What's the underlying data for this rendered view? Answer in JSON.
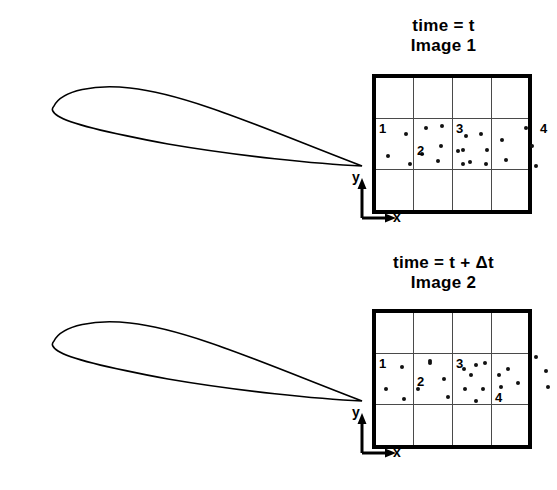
{
  "diagram": {
    "line_color": "#000000",
    "particle_color": "#111111",
    "grid_color": "#4a4a4a",
    "background": "#ffffff"
  },
  "panels": [
    {
      "id": "panel-top",
      "caption_time": "time = t",
      "caption_image": "Image 1",
      "axis": {
        "x_label": "x",
        "y_label": "y"
      },
      "grid": {
        "columns": 4,
        "rows": 3
      },
      "cells": [
        {
          "label": "1",
          "label_pos": {
            "left": 3,
            "top": 4
          },
          "particles": [
            {
              "x": 30,
              "y": 16
            },
            {
              "x": 66,
              "y": 8
            },
            {
              "x": 12,
              "y": 38
            },
            {
              "x": 46,
              "y": 36
            },
            {
              "x": 34,
              "y": 46
            }
          ]
        },
        {
          "label": "2",
          "label_pos": {
            "left": 3,
            "top": 26
          },
          "particles": [
            {
              "x": 12,
              "y": 10
            },
            {
              "x": 52,
              "y": 18
            },
            {
              "x": 27,
              "y": 28
            },
            {
              "x": 24,
              "y": 43
            },
            {
              "x": 56,
              "y": 44
            },
            {
              "x": 44,
              "y": 33
            }
          ]
        },
        {
          "label": "3",
          "label_pos": {
            "left": 3,
            "top": 4
          },
          "particles": [
            {
              "x": 28,
              "y": 16
            },
            {
              "x": 10,
              "y": 32
            },
            {
              "x": 34,
              "y": 32
            },
            {
              "x": 10,
              "y": 46
            },
            {
              "x": 33,
              "y": 46
            }
          ]
        },
        {
          "label": "4",
          "label_pos": {
            "left": 48,
            "top": 4
          },
          "particles": [
            {
              "x": 34,
              "y": 10
            },
            {
              "x": 10,
              "y": 22
            },
            {
              "x": 40,
              "y": 28
            },
            {
              "x": 14,
              "y": 42
            },
            {
              "x": 44,
              "y": 48
            }
          ]
        }
      ]
    },
    {
      "id": "panel-bottom",
      "caption_time": "time = t + Δt",
      "caption_image": "Image 2",
      "axis": {
        "x_label": "x",
        "y_label": "y"
      },
      "grid": {
        "columns": 4,
        "rows": 3
      },
      "cells": [
        {
          "label": "1",
          "label_pos": {
            "left": 3,
            "top": 4
          },
          "particles": [
            {
              "x": 26,
              "y": 14
            },
            {
              "x": 54,
              "y": 8
            },
            {
              "x": 10,
              "y": 36
            },
            {
              "x": 42,
              "y": 36
            },
            {
              "x": 28,
              "y": 46
            }
          ]
        },
        {
          "label": "2",
          "label_pos": {
            "left": 3,
            "top": 22
          },
          "particles": [
            {
              "x": 16,
              "y": 10
            },
            {
              "x": 50,
              "y": 16
            },
            {
              "x": 62,
              "y": 12
            },
            {
              "x": 30,
              "y": 26
            },
            {
              "x": 34,
              "y": 44
            },
            {
              "x": 62,
              "y": 48
            }
          ]
        },
        {
          "label": "3",
          "label_pos": {
            "left": 3,
            "top": 4
          },
          "particles": [
            {
              "x": 32,
              "y": 10
            },
            {
              "x": 18,
              "y": 22
            },
            {
              "x": 46,
              "y": 22
            },
            {
              "x": 12,
              "y": 36
            },
            {
              "x": 30,
              "y": 36
            },
            {
              "x": 48,
              "y": 34
            }
          ]
        },
        {
          "label": "4",
          "label_pos": {
            "left": 3,
            "top": 38
          },
          "particles": [
            {
              "x": 44,
              "y": 4
            },
            {
              "x": 16,
              "y": 16
            },
            {
              "x": 54,
              "y": 18
            },
            {
              "x": 26,
              "y": 30
            },
            {
              "x": 56,
              "y": 34
            }
          ]
        }
      ]
    }
  ]
}
